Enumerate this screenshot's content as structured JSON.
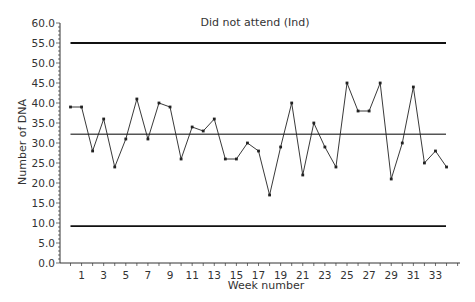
{
  "chart_data": {
    "type": "line",
    "title": "Did not attend (Ind)",
    "xlabel": "Week number",
    "ylabel": "Number of DNA",
    "ylim": [
      0,
      60
    ],
    "y_ticks": [
      "0.0",
      "5.0",
      "10.0",
      "15.0",
      "20.0",
      "25.0",
      "30.0",
      "35.0",
      "40.0",
      "45.0",
      "50.0",
      "55.0",
      "60.0"
    ],
    "x_tick_labels": [
      "1",
      "3",
      "5",
      "7",
      "9",
      "11",
      "13",
      "15",
      "17",
      "19",
      "21",
      "23",
      "25",
      "27",
      "29",
      "31",
      "33"
    ],
    "x": [
      0,
      1,
      2,
      3,
      4,
      5,
      6,
      7,
      8,
      9,
      10,
      11,
      12,
      13,
      14,
      15,
      16,
      17,
      18,
      19,
      20,
      21,
      22,
      23,
      24,
      25,
      26,
      27,
      28,
      29,
      30,
      31,
      32,
      33,
      34
    ],
    "series": [
      {
        "name": "Number of DNA",
        "values": [
          39,
          39,
          28,
          36,
          24,
          31,
          41,
          31,
          40,
          39,
          26,
          34,
          33,
          36,
          26,
          26,
          30,
          28,
          17,
          29,
          40,
          22,
          35,
          29,
          24,
          45,
          38,
          38,
          45,
          21,
          30,
          44,
          25,
          28,
          24
        ]
      }
    ],
    "reference_lines": {
      "upper_control_limit": 55.0,
      "center_line": 32.2,
      "lower_control_limit": 9.2
    },
    "grid": false,
    "legend": "none"
  },
  "colors": {
    "line": "#222222",
    "control_limits": "#111111",
    "center_line": "#555555",
    "axis": "#333333"
  }
}
